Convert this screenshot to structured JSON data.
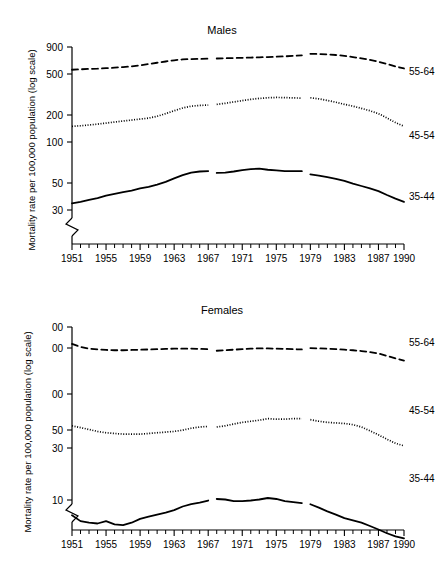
{
  "figure": {
    "y_axis_title": "Mortality rate per 100,000 population (log scale)",
    "panels": [
      "Males",
      "Females"
    ]
  },
  "chart_data": [
    {
      "type": "line",
      "title": "Males",
      "xlabel": "",
      "ylabel": "Mortality rate per 100,000 population (log scale)",
      "yscale": "log",
      "ylim": [
        28,
        1000
      ],
      "xlim": [
        1951,
        1990
      ],
      "grid": false,
      "legend_position": "right-inline",
      "axis_break": true,
      "ytick_values": [
        900,
        500,
        200,
        100,
        50,
        30
      ],
      "ytick_labels": [
        "900",
        "500",
        "200",
        "100",
        "50",
        "30"
      ],
      "xtick_labels": [
        "1951",
        "1955",
        "1959",
        "1963",
        "1967",
        "1971",
        "1975",
        "1979",
        "1983",
        "1987",
        "1990"
      ],
      "xtick_values": [
        1951,
        1955,
        1959,
        1963,
        1967,
        1971,
        1975,
        1979,
        1983,
        1987,
        1990
      ],
      "xtick_minor_step": 1,
      "series": [
        {
          "name": "55-64",
          "label": "55-64",
          "style": "dashed",
          "x": [
            1951,
            1952,
            1953,
            1954,
            1955,
            1956,
            1957,
            1958,
            1959,
            1960,
            1961,
            1962,
            1963,
            1964,
            1965,
            1966,
            1967,
            1968,
            1969,
            1970,
            1971,
            1972,
            1973,
            1974,
            1975,
            1976,
            1977,
            1978,
            1979,
            1980,
            1981,
            1982,
            1983,
            1984,
            1985,
            1986,
            1987,
            1988,
            1989,
            1990
          ],
          "y": [
            560,
            565,
            570,
            572,
            578,
            585,
            592,
            600,
            615,
            630,
            648,
            665,
            682,
            695,
            700,
            702,
            705,
            708,
            712,
            715,
            718,
            722,
            726,
            730,
            735,
            740,
            748,
            756,
            780,
            778,
            772,
            762,
            748,
            730,
            710,
            688,
            662,
            632,
            600,
            575
          ]
        },
        {
          "name": "45-54",
          "label": "45-54",
          "style": "dotted",
          "x": [
            1951,
            1952,
            1953,
            1954,
            1955,
            1956,
            1957,
            1958,
            1959,
            1960,
            1961,
            1962,
            1963,
            1964,
            1965,
            1966,
            1967,
            1968,
            1969,
            1970,
            1971,
            1972,
            1973,
            1974,
            1975,
            1976,
            1977,
            1978,
            1979,
            1980,
            1981,
            1982,
            1983,
            1984,
            1985,
            1986,
            1987,
            1988,
            1989,
            1990
          ],
          "y": [
            172,
            174,
            177,
            180,
            184,
            188,
            192,
            196,
            200,
            204,
            212,
            224,
            238,
            252,
            262,
            266,
            268,
            272,
            278,
            286,
            294,
            302,
            308,
            312,
            314,
            313,
            311,
            310,
            312,
            305,
            295,
            284,
            272,
            262,
            250,
            238,
            224,
            205,
            186,
            172
          ]
        },
        {
          "name": "35-44",
          "label": "35-44",
          "style": "solid",
          "x": [
            1951,
            1952,
            1953,
            1954,
            1955,
            1956,
            1957,
            1958,
            1959,
            1960,
            1961,
            1962,
            1963,
            1964,
            1965,
            1966,
            1967,
            1968,
            1969,
            1970,
            1971,
            1972,
            1973,
            1974,
            1975,
            1976,
            1977,
            1978,
            1979,
            1980,
            1981,
            1982,
            1983,
            1984,
            1985,
            1986,
            1987,
            1988,
            1989,
            1990
          ],
          "y": [
            34.5,
            35.5,
            37,
            38.5,
            40.5,
            42,
            43.5,
            45,
            47,
            48.5,
            51,
            54,
            58,
            62,
            65.5,
            67,
            67.5,
            65,
            65.5,
            67,
            69,
            70.5,
            71,
            69.5,
            68.5,
            67.5,
            67.5,
            67.5,
            63,
            61.5,
            59.5,
            57.5,
            55,
            52,
            49.5,
            47,
            44.5,
            41,
            38,
            35.5
          ]
        }
      ],
      "segment_breaks": [
        1967.5,
        1978.5
      ]
    },
    {
      "type": "line",
      "title": "Females",
      "xlabel": "",
      "ylabel": "Mortality rate per 100,000 population (log scale)",
      "yscale": "log",
      "ylim": [
        4,
        320
      ],
      "xlim": [
        1951,
        1990
      ],
      "grid": false,
      "legend_position": "right-inline",
      "axis_break": true,
      "ytick_values": [
        300,
        200,
        100,
        50,
        30,
        10
      ],
      "ytick_labels": [
        "00",
        "00",
        "00",
        "50",
        "30",
        "10"
      ],
      "ytick_labels_full": [
        "300",
        "200",
        "100",
        "50",
        "30",
        "10"
      ],
      "xtick_labels": [
        "1951",
        "1955",
        "1959",
        "1963",
        "1967",
        "1971",
        "1975",
        "1979",
        "1983",
        "1987",
        "1990"
      ],
      "xtick_values": [
        1951,
        1955,
        1959,
        1963,
        1967,
        1971,
        1975,
        1979,
        1983,
        1987,
        1990
      ],
      "xtick_minor_step": 1,
      "series": [
        {
          "name": "55-64",
          "label": "55-64",
          "style": "dashed",
          "x": [
            1951,
            1952,
            1953,
            1954,
            1955,
            1956,
            1957,
            1958,
            1959,
            1960,
            1961,
            1962,
            1963,
            1964,
            1965,
            1966,
            1967,
            1968,
            1969,
            1970,
            1971,
            1972,
            1973,
            1974,
            1975,
            1976,
            1977,
            1978,
            1979,
            1980,
            1981,
            1982,
            1983,
            1984,
            1985,
            1986,
            1987,
            1988,
            1989,
            1990
          ],
          "y": [
            215,
            203,
            196,
            193,
            191,
            190,
            190,
            191,
            192,
            193,
            194,
            195,
            196,
            196,
            196,
            195,
            194,
            188,
            190,
            192,
            194,
            196,
            197,
            197,
            196,
            195,
            194,
            193,
            198,
            197,
            196,
            194,
            192,
            190,
            187,
            183,
            178,
            170,
            162,
            155
          ]
        },
        {
          "name": "45-54",
          "label": "45-54",
          "style": "dotted",
          "x": [
            1951,
            1952,
            1953,
            1954,
            1955,
            1956,
            1957,
            1958,
            1959,
            1960,
            1961,
            1962,
            1963,
            1964,
            1965,
            1966,
            1967,
            1968,
            1969,
            1970,
            1971,
            1972,
            1973,
            1974,
            1975,
            1976,
            1977,
            1978,
            1979,
            1980,
            1981,
            1982,
            1983,
            1984,
            1985,
            1986,
            1987,
            1988,
            1989,
            1990
          ],
          "y": [
            43,
            41.5,
            40,
            38.5,
            37.5,
            37,
            36.5,
            36.5,
            36.5,
            37,
            37.5,
            38,
            38.5,
            39.5,
            41,
            42,
            42.5,
            42,
            43,
            44.5,
            46,
            47,
            48,
            49.5,
            49,
            49,
            49.5,
            49.5,
            48.5,
            47,
            46,
            45.5,
            45,
            44,
            42,
            39,
            36,
            33,
            30.5,
            29
          ]
        },
        {
          "name": "35-44",
          "label": "35-44",
          "style": "solid",
          "x": [
            1951,
            1952,
            1953,
            1954,
            1955,
            1956,
            1957,
            1958,
            1959,
            1960,
            1961,
            1962,
            1963,
            1964,
            1965,
            1966,
            1967,
            1968,
            1969,
            1970,
            1971,
            1972,
            1973,
            1974,
            1975,
            1976,
            1977,
            1978,
            1979,
            1980,
            1981,
            1982,
            1983,
            1984,
            1985,
            1986,
            1987,
            1988,
            1989,
            1990
          ],
          "y": [
            7.4,
            6.6,
            6.4,
            6.3,
            6.6,
            6.2,
            6.1,
            6.4,
            6.9,
            7.2,
            7.5,
            7.8,
            8.2,
            8.8,
            9.2,
            9.5,
            9.9,
            10.2,
            10.1,
            9.8,
            9.8,
            9.9,
            10.1,
            10.4,
            10.2,
            9.8,
            9.6,
            9.4,
            9.2,
            8.6,
            8.0,
            7.5,
            7.0,
            6.7,
            6.4,
            6.0,
            5.6,
            5.2,
            4.9,
            4.7
          ]
        }
      ],
      "segment_breaks": [
        1967.5,
        1978.5
      ]
    }
  ]
}
